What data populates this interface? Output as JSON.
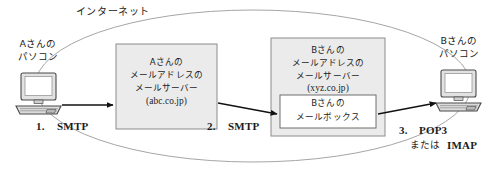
{
  "diagram": {
    "title_label": "インターネット",
    "cloud": {
      "name": "internet-cloud"
    },
    "endpoints": [
      {
        "id": "sender-pc",
        "line1": "Aさんの",
        "line2": "パソコン"
      },
      {
        "id": "receiver-pc",
        "line1": "Bさんの",
        "line2": "パソコン"
      }
    ],
    "servers": [
      {
        "id": "sender-mail-server",
        "lines": [
          "Aさんの",
          "メールアドレスの",
          "メールサーバー"
        ],
        "domain": "(abc.co.jp)",
        "fill": "#ebebeb",
        "border": "#8c8c8c"
      },
      {
        "id": "receiver-mail-server",
        "lines": [
          "Bさんの",
          "メールアドレスの",
          "メールサーバー"
        ],
        "domain": "(xyz.co.jp)",
        "fill": "#ebebeb",
        "border": "#8c8c8c",
        "inner_box": {
          "id": "mailbox",
          "lines": [
            "Bさんの",
            "メールボックス"
          ],
          "fill": "#ffffff",
          "border": "#6e6e6e"
        }
      }
    ],
    "flows": [
      {
        "id": "flow-1",
        "number": "1.",
        "protocol": "SMTP"
      },
      {
        "id": "flow-2",
        "number": "2.",
        "protocol": "SMTP"
      },
      {
        "id": "flow-3",
        "number": "3.",
        "protocol": "POP3",
        "protocol_alt_prefix": "または",
        "protocol_alt": "IMAP"
      }
    ],
    "colors": {
      "ink": "#1c1c1c",
      "cloud_stroke": "#9b9b9b",
      "server_fill": "#ebebeb",
      "server_border": "#8c8c8c",
      "arrow": "#111111",
      "monitor_fill": "#e2e2e2"
    }
  }
}
